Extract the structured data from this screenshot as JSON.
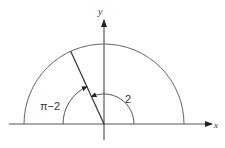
{
  "diagram": {
    "title": "",
    "axes": {
      "x_label": "x",
      "y_label": "y"
    },
    "labels": {
      "angle_2": "2",
      "angle_pi_minus_2": "π−2"
    },
    "colors": {
      "line": "#333333",
      "arc": "#555555",
      "background": "#ffffff"
    }
  }
}
